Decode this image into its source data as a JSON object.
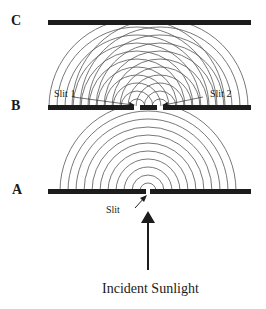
{
  "diagram": {
    "screens": [
      {
        "id": "C",
        "label": "C"
      },
      {
        "id": "B",
        "label": "B"
      },
      {
        "id": "A",
        "label": "A"
      }
    ],
    "labels": {
      "slit1": "Slit 1",
      "slit2": "Slit 2",
      "slit": "Slit",
      "incident": "Incident Sunlight"
    },
    "colors": {
      "bar": "#1c1c1c",
      "wave": "#555555",
      "text": "#1a1a1a"
    }
  }
}
